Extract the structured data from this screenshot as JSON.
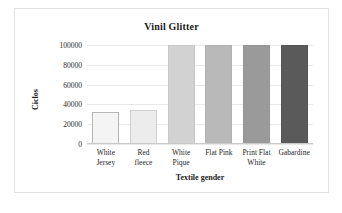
{
  "chart_data": {
    "type": "bar",
    "title": "Vinil Glitter",
    "xlabel": "Textile gender",
    "ylabel": "Ciclos",
    "categories": [
      "White Jersey",
      "Red fleece",
      "White Pique",
      "Flat Pink",
      "Print Flat White",
      "Gabardine"
    ],
    "category_lines": [
      [
        "White",
        "Jersey"
      ],
      [
        "Red",
        "fleece"
      ],
      [
        "White",
        "Pique"
      ],
      [
        "Flat Pink",
        ""
      ],
      [
        "Print Flat",
        "White"
      ],
      [
        "Gabardine",
        ""
      ]
    ],
    "values": [
      32000,
      34000,
      100000,
      100000,
      100000,
      100000
    ],
    "bar_colors": [
      "#f4f4f4",
      "#ececec",
      "#d2d2d2",
      "#b9b9b9",
      "#9a9a9a",
      "#5a5a5a"
    ],
    "bar_borders": [
      "#b5b5b5",
      "#cfcfcf",
      "#c8c8c8",
      "#b2b2b2",
      "#949494",
      "#545454"
    ],
    "ylim": [
      0,
      100000
    ],
    "yticks": [
      "0",
      "20000",
      "40000",
      "60000",
      "80000",
      "100000"
    ],
    "ytick_values": [
      0,
      20000,
      40000,
      60000,
      80000,
      100000
    ],
    "grid": true,
    "legend": "none"
  },
  "caption": {
    "text": ""
  }
}
